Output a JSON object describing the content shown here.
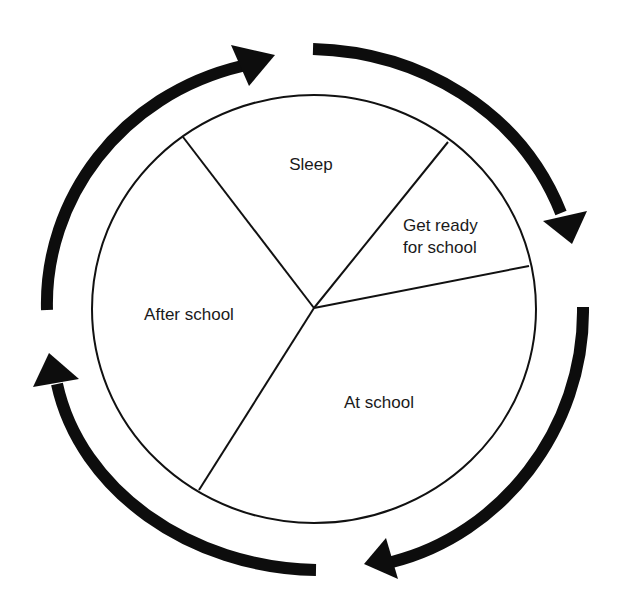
{
  "diagram": {
    "type": "cycle-pie",
    "segments": [
      {
        "id": "sleep",
        "label": "Sleep"
      },
      {
        "id": "get-ready",
        "label_lines": [
          "Get ready",
          "for school"
        ]
      },
      {
        "id": "at-school",
        "label": "At school"
      },
      {
        "id": "after-school",
        "label": "After school"
      }
    ],
    "cycle_direction": "clockwise",
    "arrow_count": 4,
    "colors": {
      "stroke": "#111111",
      "arrow": "#0d0d0d",
      "background": "#ffffff",
      "text": "#1a1a1a"
    }
  }
}
